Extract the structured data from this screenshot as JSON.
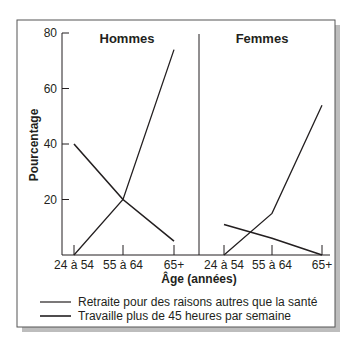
{
  "chart_data": {
    "type": "line",
    "ylabel": "Pourcentage",
    "xlabel": "Âge (années)",
    "ylim": [
      0,
      80
    ],
    "yticks": [
      20,
      40,
      60,
      80
    ],
    "categories": [
      "24 à 54",
      "55 à 64",
      "65+"
    ],
    "grid": false,
    "legend_position": "bottom",
    "panels": [
      {
        "title": "Hommes",
        "series": [
          {
            "name": "Retraite pour des raisons autres que la santé",
            "values": [
              0,
              20,
              74
            ]
          },
          {
            "name": "Travaille plus de 45 heures par semaine",
            "values": [
              40,
              20,
              5
            ]
          }
        ]
      },
      {
        "title": "Femmes",
        "series": [
          {
            "name": "Retraite pour des raisons autres que la santé",
            "values": [
              0,
              15,
              54
            ]
          },
          {
            "name": "Travaille plus de 45 heures par semaine",
            "values": [
              11,
              6,
              0
            ]
          }
        ]
      }
    ],
    "legend": [
      "Retraite pour des raisons autres que la santé",
      "Travaille plus de 45 heures par semaine"
    ]
  },
  "colors": {
    "line": "#231f20",
    "frame": "#555555",
    "shadow": "#bdbdbd"
  }
}
